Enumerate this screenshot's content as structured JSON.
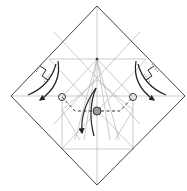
{
  "diagram": {
    "type": "origami-crease-diagram",
    "colors": {
      "background": "#ffffff",
      "outline": "#444444",
      "crease": "#b4b4b4",
      "arrow": "#222222",
      "center_point_fill": "#999999"
    },
    "symbols": [
      {
        "name": "left-pleat-symbol",
        "label": "pleat"
      },
      {
        "name": "right-pleat-symbol",
        "label": "pleat"
      },
      {
        "name": "left-fold-arrow",
        "label": "fold down-left"
      },
      {
        "name": "right-fold-arrow",
        "label": "fold down-right"
      },
      {
        "name": "center-fold-arrow",
        "label": "fold down"
      },
      {
        "name": "left-reference-circle",
        "label": "reference point"
      },
      {
        "name": "right-reference-circle",
        "label": "reference point"
      },
      {
        "name": "center-reference-point",
        "label": "reference point"
      }
    ]
  }
}
